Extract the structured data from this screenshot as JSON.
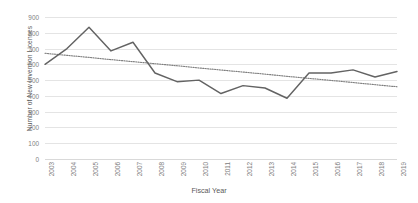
{
  "chart_data": {
    "type": "line",
    "title": "",
    "xlabel": "Fiscal Year",
    "ylabel": "Number of New Invention Licenses",
    "categories": [
      "2003",
      "2004",
      "2005",
      "2006",
      "2007",
      "2008",
      "2009",
      "2010",
      "2011",
      "2012",
      "2013",
      "2014",
      "2015",
      "2016",
      "2017",
      "2018",
      "2019"
    ],
    "series": [
      {
        "name": "New Invention Licenses",
        "style": "solid",
        "color": "#636363",
        "values": [
          600,
          700,
          835,
          685,
          740,
          545,
          490,
          500,
          415,
          465,
          450,
          385,
          545,
          545,
          565,
          520,
          555
        ]
      },
      {
        "name": "Linear trendline",
        "style": "dotted",
        "color": "#7f7f7f",
        "values": [
          670,
          657,
          644,
          630,
          617,
          604,
          591,
          577,
          564,
          551,
          538,
          524,
          511,
          498,
          485,
          471,
          458
        ]
      }
    ],
    "ylim": [
      0,
      900
    ],
    "ytick_step": 100,
    "yticks": [
      "900",
      "800",
      "700",
      "600",
      "500",
      "400",
      "300",
      "200",
      "100",
      "0"
    ],
    "grid": true,
    "legend": "none",
    "legend_position": "none"
  }
}
